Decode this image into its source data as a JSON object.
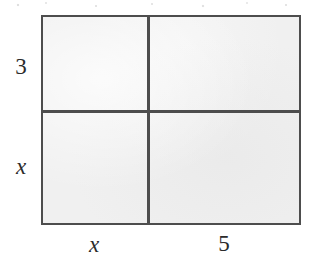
{
  "figure": {
    "kind": "area-model-rectangle",
    "fill_color": "#f0f0f0",
    "line_color": "#4d4d4d",
    "text_color": "#2b2b2b"
  },
  "labels": {
    "height_top": "3",
    "height_bottom": "x",
    "width_left": "x",
    "width_right": "5"
  },
  "geometry": {
    "rect": {
      "left": 41,
      "top": 15,
      "width": 260,
      "height": 210
    },
    "vertical_divider_x": 147,
    "horizontal_divider_y": 110,
    "columns": [
      {
        "label": "x",
        "width_px": 106
      },
      {
        "label": "5",
        "width_px": 152
      }
    ],
    "rows": [
      {
        "label": "3",
        "height_px": 95
      },
      {
        "label": "x",
        "height_px": 113
      }
    ]
  }
}
